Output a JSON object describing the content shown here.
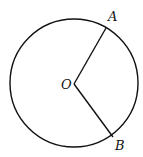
{
  "diagram": {
    "type": "circle-with-sector",
    "circle": {
      "cx": 74,
      "cy": 83,
      "r": 64
    },
    "center": {
      "label": "O",
      "x": 74,
      "y": 84
    },
    "points": [
      {
        "label": "A",
        "x": 106,
        "y": 28
      },
      {
        "label": "B",
        "x": 113,
        "y": 137
      }
    ],
    "segments": [
      [
        "O",
        "A"
      ],
      [
        "O",
        "B"
      ]
    ],
    "stroke_color": "#111111"
  }
}
